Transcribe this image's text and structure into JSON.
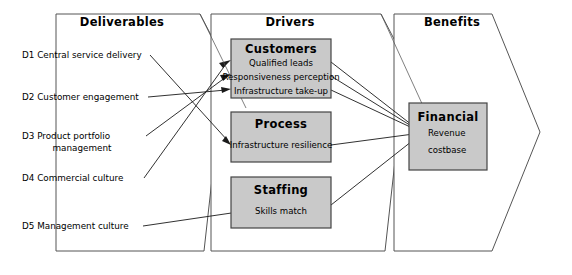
{
  "diagram": {
    "title_left": "Deliverables",
    "title_middle": "Drivers",
    "title_right": "Benefits",
    "colors": {
      "box_fill": "#c9c9c9",
      "box_stroke": "#444444",
      "panel_stroke": "#555555",
      "line": "#1a1a1a",
      "background": "#ffffff",
      "text": "#000000"
    }
  },
  "deliverables": {
    "panel_title": "Deliverables",
    "items": [
      {
        "code": "D1",
        "label": "D1 Central service delivery",
        "line1": "D1 Central service delivery",
        "line2": ""
      },
      {
        "code": "D2",
        "label": "D2 Customer engagement",
        "line1": "D2 Customer engagement",
        "line2": ""
      },
      {
        "code": "D3",
        "label": "D3 Product portfolio management",
        "line1": "D3 Product portfolio",
        "line2": "management"
      },
      {
        "code": "D4",
        "label": "D4 Commercial culture",
        "line1": "D4 Commercial culture",
        "line2": ""
      },
      {
        "code": "D5",
        "label": "D5 Management culture",
        "line1": "D5 Management culture",
        "line2": ""
      }
    ]
  },
  "drivers": {
    "panel_title": "Drivers",
    "boxes": [
      {
        "title": "Customers",
        "items": [
          "Qualified leads",
          "Responsiveness perception",
          "Infrastructure take-up"
        ]
      },
      {
        "title": "Process",
        "items": [
          "Infrastructure resilience"
        ]
      },
      {
        "title": "Staffing",
        "items": [
          "Skills match"
        ]
      }
    ]
  },
  "benefits": {
    "panel_title": "Benefits",
    "boxes": [
      {
        "title": "Financial",
        "items": [
          "Revenue",
          "costbase"
        ]
      }
    ]
  }
}
